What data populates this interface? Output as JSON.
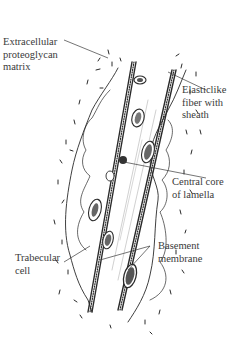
{
  "diagram": {
    "labels": [
      {
        "id": "extracellular",
        "lines": [
          "Extracellular",
          "proteoglycan",
          "matrix"
        ]
      },
      {
        "id": "elastic",
        "lines": [
          "Elasticlike",
          "fiber with",
          "sheath"
        ]
      },
      {
        "id": "central",
        "lines": [
          "Central core",
          "of lamella"
        ]
      },
      {
        "id": "trabecular",
        "lines": [
          "Trabecular",
          "cell"
        ]
      },
      {
        "id": "basement",
        "lines": [
          "Basement",
          "membrane"
        ]
      }
    ],
    "colors": {
      "ink": "#2a2a2a",
      "label": "#3a3a3a",
      "background": "#ffffff"
    }
  }
}
